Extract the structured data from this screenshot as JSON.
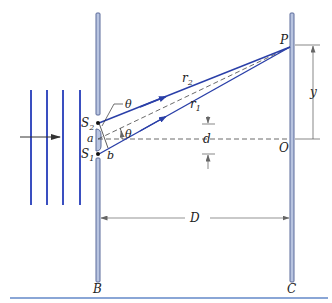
{
  "figure": {
    "type": "double-slit interference diagram",
    "colors": {
      "ray": "#2a3fa8",
      "wave": "#3a4fc0",
      "barrier_fill": "#b8c4e0",
      "barrier_stroke": "#5a6a9a",
      "dim_line": "#555555",
      "rule": "#8aa6d6"
    },
    "labels": {
      "P": "P",
      "y": "y",
      "O": "O",
      "r2": "r",
      "r2_sub": "2",
      "r1": "r",
      "r1_sub": "1",
      "d": "d",
      "S2": "S",
      "S2_sub": "2",
      "S1": "S",
      "S1_sub": "1",
      "alpha": "a",
      "b": "b",
      "theta_top": "θ",
      "theta_angle": "θ",
      "D": "D",
      "B": "B",
      "C": "C"
    }
  }
}
